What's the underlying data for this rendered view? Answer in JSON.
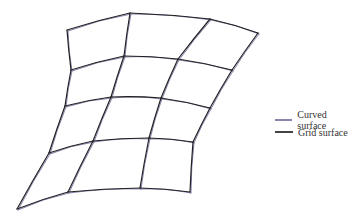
{
  "legend": {
    "items": [
      {
        "label": "Curved surface",
        "color": "#8a84b0"
      },
      {
        "label": "Grid surface",
        "color": "#444444"
      }
    ]
  },
  "grid": {
    "rows": [
      [
        [
          67,
          30
        ],
        [
          130,
          13
        ],
        [
          210,
          19
        ],
        [
          258,
          33
        ]
      ],
      [
        [
          71,
          70
        ],
        [
          124,
          56
        ],
        [
          178,
          59
        ],
        [
          232,
          70
        ]
      ],
      [
        [
          65,
          106
        ],
        [
          111,
          97
        ],
        [
          161,
          98
        ],
        [
          210,
          108
        ]
      ],
      [
        [
          49,
          153
        ],
        [
          93,
          141
        ],
        [
          149,
          138
        ],
        [
          193,
          142
        ]
      ],
      [
        [
          17,
          209
        ],
        [
          68,
          192
        ],
        [
          140,
          188
        ],
        [
          190,
          192
        ]
      ]
    ],
    "curved_color": "#8a84b0",
    "grid_color": "#222222"
  }
}
